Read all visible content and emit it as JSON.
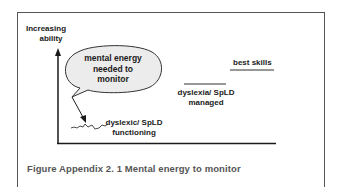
{
  "diagram": {
    "axis_label_line1": "Increasing",
    "axis_label_line2": "ability",
    "bubble": {
      "line1": "mental energy",
      "line2": "needed to",
      "line3": "monitor"
    },
    "best_skills": "best skills",
    "managed_line1": "dyslexia/ SpLD",
    "managed_line2": "managed",
    "functioning_line1": "dyslexic/ SpLD",
    "functioning_line2": "functioning"
  },
  "caption": "Figure Appendix 2. 1  Mental energy to monitor",
  "colors": {
    "bubble_fill": "#ececec",
    "line": "#1a1a1a",
    "caption": "#555555"
  }
}
